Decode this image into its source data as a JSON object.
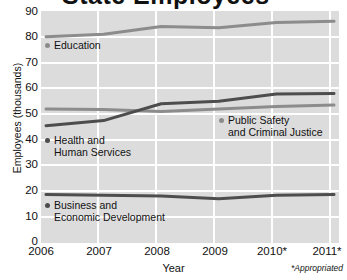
{
  "title": "State Employees",
  "axis": {
    "ylabel": "Employees (thousands)",
    "xlabel": "Year",
    "footnote": "*Appropriated"
  },
  "yticks": [
    "0",
    "10",
    "20",
    "30",
    "40",
    "50",
    "60",
    "70",
    "80",
    "90"
  ],
  "xticks": [
    "2006",
    "2007",
    "2008",
    "2009",
    "2010*",
    "2011*"
  ],
  "labels": {
    "education": "Education",
    "public_safety_l1": "Public Safety",
    "public_safety_l2": "and Criminal Justice",
    "health_l1": "Health and",
    "health_l2": "Human Services",
    "business_l1": "Business and",
    "business_l2": "Economic Development"
  },
  "colors": {
    "plot_background": "#dcdcdc",
    "gridline": "#ffffff",
    "education_line": "#8c8c8c",
    "public_safety_line": "#8c8c8c",
    "health_line": "#4d4d4d",
    "business_line": "#4d4d4d",
    "text": "#111111"
  },
  "chart_data": {
    "type": "line",
    "title": "State Employees",
    "xlabel": "Year",
    "ylabel": "Employees (thousands)",
    "categories": [
      "2006",
      "2007",
      "2008",
      "2009",
      "2010*",
      "2011*"
    ],
    "ylim": [
      0,
      90
    ],
    "ytick_step": 10,
    "grid": true,
    "legend_position": "inline-labels",
    "annotations": [
      "*Appropriated"
    ],
    "series": [
      {
        "name": "Education",
        "color": "#8c8c8c",
        "values": [
          80.0,
          81.0,
          84.0,
          83.5,
          85.5,
          86.0
        ]
      },
      {
        "name": "Public Safety and Criminal Justice",
        "color": "#8c8c8c",
        "values": [
          52.0,
          51.8,
          51.0,
          52.0,
          53.0,
          53.5
        ]
      },
      {
        "name": "Health and Human Services",
        "color": "#4d4d4d",
        "values": [
          45.5,
          47.5,
          54.0,
          55.0,
          57.8,
          58.0
        ]
      },
      {
        "name": "Business and Economic Development",
        "color": "#4d4d4d",
        "values": [
          18.8,
          18.5,
          18.2,
          17.2,
          18.5,
          18.8
        ]
      }
    ]
  }
}
